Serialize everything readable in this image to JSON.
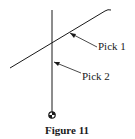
{
  "figure": {
    "caption": "Figure 11",
    "labels": {
      "pick1": "Pick 1",
      "pick2": "Pick 2"
    },
    "colors": {
      "stroke": "#1a1a1a",
      "background": "#ffffff"
    }
  }
}
